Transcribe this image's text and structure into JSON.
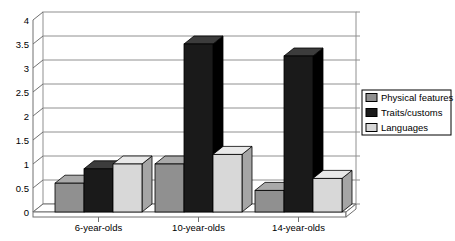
{
  "chart_data": {
    "type": "bar",
    "variant": "3d-column",
    "title": "",
    "xlabel": "",
    "ylabel": "",
    "categories": [
      "6-year-olds",
      "10-year-olds",
      "14-year-olds"
    ],
    "series": [
      {
        "name": "Physical features",
        "values": [
          0.6,
          1.0,
          0.45
        ],
        "front": "#909090",
        "top": "#a9a9a9",
        "side": "#686868"
      },
      {
        "name": "Traits/customs",
        "values": [
          0.9,
          3.5,
          3.25
        ],
        "front": "#1a1a1a",
        "top": "#3c3c3c",
        "side": "#000000"
      },
      {
        "name": "Languages",
        "values": [
          1.0,
          1.2,
          0.7
        ],
        "front": "#d8d8d8",
        "top": "#e9e9e9",
        "side": "#a5a5a5"
      }
    ],
    "ylim": [
      0,
      4
    ],
    "ytick_step": 0.5,
    "ytick_labels": [
      "0",
      "0.5",
      "1",
      "1.5",
      "2",
      "2.5",
      "3",
      "3.5",
      "4"
    ],
    "grid": true,
    "legend_position": "right"
  },
  "colors": {
    "background": "#ffffff",
    "gridline": "#909090",
    "wall_edge": "#707070",
    "bar_outline": "#000000",
    "legend_border": "#000000",
    "text": "#000000"
  }
}
